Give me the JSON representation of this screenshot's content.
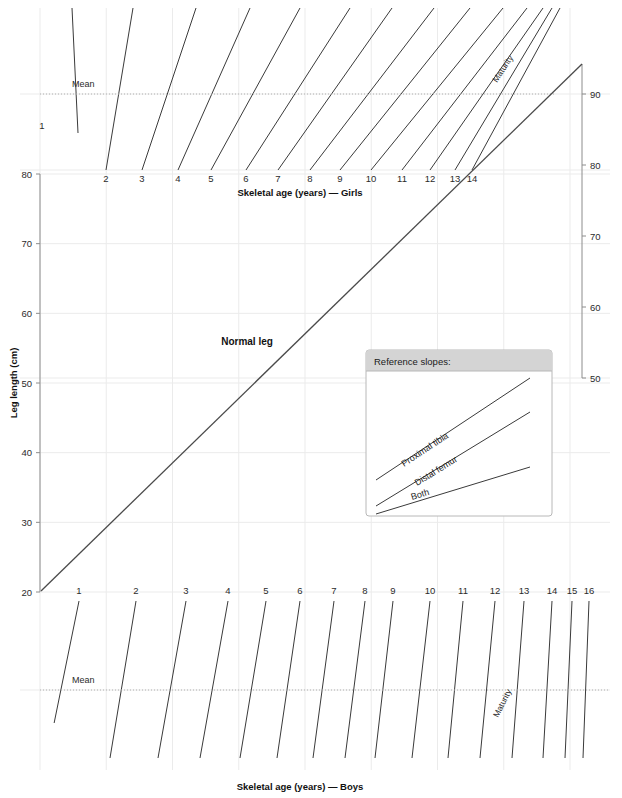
{
  "chart_data": {
    "type": "line",
    "ylabel": "Leg length (cm)",
    "xlabel_top": "Skeletal age (years) — Girls",
    "xlabel_bottom": "Skeletal age (years) — Boys",
    "left_axis": {
      "label": "Leg length (cm)",
      "ticks": [
        "80",
        "70",
        "60",
        "50",
        "40",
        "30",
        "20"
      ],
      "values": [
        80,
        70,
        60,
        50,
        40,
        30,
        20
      ],
      "ylim": [
        20,
        80
      ]
    },
    "right_axis": {
      "ticks": [
        "90",
        "80",
        "70",
        "60",
        "50"
      ],
      "values": [
        90,
        80,
        70,
        60,
        50
      ],
      "ylim": [
        50,
        90
      ]
    },
    "girls_axis": {
      "label": "Skeletal age (years) — Girls",
      "ages": [
        "1",
        "2",
        "3",
        "4",
        "5",
        "6",
        "7",
        "8",
        "9",
        "10",
        "11",
        "12",
        "13",
        "14"
      ],
      "mean_label": "Mean",
      "maturity_label": "Maturity"
    },
    "boys_axis": {
      "label": "Skeletal age (years) — Boys",
      "ages": [
        "1",
        "2",
        "3",
        "4",
        "5",
        "6",
        "7",
        "8",
        "9",
        "10",
        "11",
        "12",
        "13",
        "14",
        "15",
        "16"
      ],
      "mean_label": "Mean",
      "maturity_label": "Maturity"
    },
    "normal_leg": {
      "label": "Normal leg",
      "description": "Main diagonal reference line rising from lower-left to upper-right"
    },
    "legend": {
      "title": "Reference slopes:",
      "items": [
        "Proximal tibia",
        "Distal femur",
        "Both"
      ]
    },
    "colors": {
      "grid": "#ebebeb",
      "axis": "#8c8c8c",
      "age_line": "#3a3a3a",
      "mean_line": "#b0b0b0",
      "normal_leg_line": "#4a4a4a",
      "legend_header_bg": "#d4d4d4",
      "legend_border": "#b8b8b8",
      "text": "#1a1a1a",
      "background": "#ffffff"
    }
  }
}
